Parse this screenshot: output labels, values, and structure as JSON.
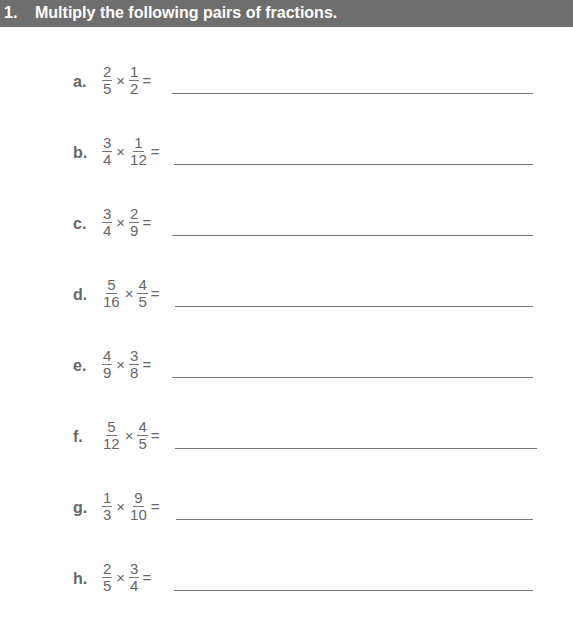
{
  "header": {
    "number": "1.",
    "title": "Multiply the following pairs of fractions."
  },
  "problems": [
    {
      "label": "a.",
      "f1": {
        "n": "2",
        "d": "5"
      },
      "f2": {
        "n": "1",
        "d": "2"
      },
      "times": "×",
      "equals": "="
    },
    {
      "label": "b.",
      "f1": {
        "n": "3",
        "d": "4"
      },
      "f2": {
        "n": "1",
        "d": "12"
      },
      "times": "×",
      "equals": "="
    },
    {
      "label": "c.",
      "f1": {
        "n": "3",
        "d": "4"
      },
      "f2": {
        "n": "2",
        "d": "9"
      },
      "times": "×",
      "equals": "="
    },
    {
      "label": "d.",
      "f1": {
        "n": "5",
        "d": "16"
      },
      "f2": {
        "n": "4",
        "d": "5"
      },
      "times": "×",
      "equals": "="
    },
    {
      "label": "e.",
      "f1": {
        "n": "4",
        "d": "9"
      },
      "f2": {
        "n": "3",
        "d": "8"
      },
      "times": "×",
      "equals": "="
    },
    {
      "label": "f.",
      "f1": {
        "n": "5",
        "d": "12"
      },
      "f2": {
        "n": "4",
        "d": "5"
      },
      "times": "×",
      "equals": "="
    },
    {
      "label": "g.",
      "f1": {
        "n": "1",
        "d": "3"
      },
      "f2": {
        "n": "9",
        "d": "10"
      },
      "times": "×",
      "equals": "="
    },
    {
      "label": "h.",
      "f1": {
        "n": "2",
        "d": "5"
      },
      "f2": {
        "n": "3",
        "d": "4"
      },
      "times": "×",
      "equals": "="
    }
  ]
}
